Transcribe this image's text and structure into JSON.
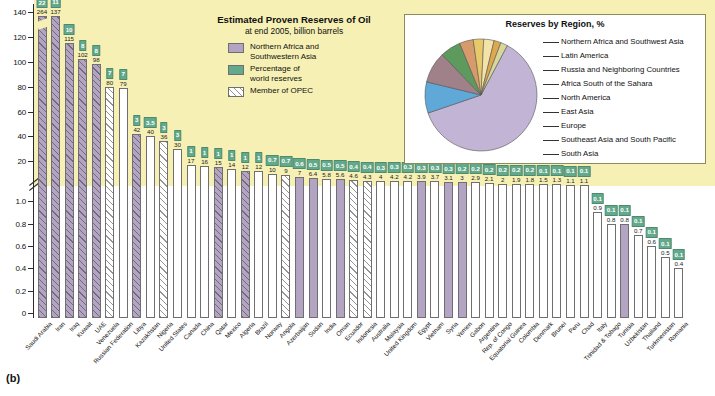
{
  "figure": {
    "caption": "(b)"
  },
  "legend": {
    "title": "Estimated Proven Reserves of Oil",
    "subtitle": "at end 2005, billion barrels",
    "items": [
      {
        "label": "Northern Africa and\nSouthwestern Asia",
        "color": "#b3a4c4",
        "pattern": "solid"
      },
      {
        "label": "Percentage of\nworld reserves",
        "color": "#63a98c",
        "pattern": "solid"
      },
      {
        "label": "Member of OPEC",
        "color": "#ffffff",
        "pattern": "hatched"
      }
    ]
  },
  "inset": {
    "title": "Reserves by Region, %",
    "labels": [
      "Northern Africa and Southwest Asia",
      "Latin America",
      "Russia and Neighboring Countries",
      "Africa South of the Sahara",
      "North America",
      "East Asia",
      "Europe",
      "Southeast Asia and South Pacific",
      "South Asia"
    ]
  },
  "chart_data": {
    "type": "bar",
    "title": "Estimated Proven Reserves of Oil",
    "subtitle": "at end 2005, billion barrels",
    "xlabel": "",
    "ylabel": "billion barrels",
    "axis_note": "broken axis: upper section 0-140 (major ticks every 20), lower section 0-1.0 (major ticks every 0.2)",
    "upper_ylim": [
      0,
      145
    ],
    "upper_ticks": [
      "0",
      "20",
      "40",
      "60",
      "80",
      "100",
      "120",
      "140"
    ],
    "lower_ylim": [
      0,
      1.1
    ],
    "lower_ticks": [
      "0",
      "0.2",
      "0.4",
      "0.6",
      "0.8",
      "1.0"
    ],
    "grid": false,
    "legend_position": "top-center",
    "categories": [
      "Saudi Arabia",
      "Iran",
      "Iraq",
      "Kuwait",
      "UAE",
      "Venezuela",
      "Russian Federation",
      "Libya",
      "Kazakhstan",
      "Nigeria",
      "United States",
      "Canada",
      "China",
      "Qatar",
      "Mexico",
      "Algeria",
      "Brazil",
      "Norway",
      "Angola",
      "Azerbaijan",
      "Sudan",
      "India",
      "Oman",
      "Ecuador",
      "Indonesia",
      "Australia",
      "Malaysia",
      "United Kingdom",
      "Egypt",
      "Vietnam",
      "Syria",
      "Yemen",
      "Gabon",
      "Argentina",
      "Rep. of Congo",
      "Equatorial Guinea",
      "Colombia",
      "Denmark",
      "Brunei",
      "Peru",
      "Chad",
      "Italy",
      "Trinidad & Tobago",
      "Tunisia",
      "Uzbekistan",
      "Thailand",
      "Turkmenistan",
      "Romania"
    ],
    "values": [
      264,
      137,
      115,
      102,
      98,
      80,
      79,
      42,
      40,
      36,
      30,
      17,
      16,
      15,
      14,
      12,
      12,
      10,
      9,
      7.0,
      6.4,
      5.8,
      5.6,
      4.6,
      4.3,
      4.0,
      4.2,
      4.2,
      3.9,
      3.7,
      3.1,
      3.0,
      2.9,
      2.1,
      2.0,
      1.9,
      1.8,
      1.5,
      1.3,
      1.1,
      1.1,
      0.9,
      0.8,
      0.8,
      0.7,
      0.6,
      0.5,
      0.4
    ],
    "percent_labels": [
      "22",
      "11",
      "10",
      "8",
      "8",
      "7",
      "7",
      "3",
      "3.5",
      "3",
      "3",
      "1",
      "1",
      "1",
      "1",
      "1",
      "1",
      "0.7",
      "0.7",
      "0.6",
      "0.5",
      "0.5",
      "0.5",
      "0.4",
      "0.4",
      "0.3",
      "0.3",
      "0.3",
      "0.3",
      "0.3",
      "0.3",
      "0.2",
      "0.2",
      "0.2",
      "0.2",
      "0.2",
      "0.2",
      "0.1",
      "0.1",
      "0.1",
      "0.1",
      "0.1",
      "0.1",
      "0.1",
      "0.1",
      "0.1",
      "0.1",
      "0.1"
    ],
    "is_northern_africa_southwest_asia": [
      true,
      true,
      true,
      true,
      true,
      false,
      false,
      true,
      false,
      false,
      false,
      false,
      false,
      true,
      false,
      true,
      false,
      false,
      false,
      true,
      true,
      false,
      true,
      false,
      false,
      false,
      false,
      false,
      true,
      false,
      true,
      true,
      false,
      false,
      false,
      false,
      false,
      false,
      false,
      false,
      false,
      false,
      false,
      true,
      false,
      false,
      false,
      false
    ],
    "is_opec": [
      true,
      true,
      true,
      true,
      true,
      true,
      false,
      true,
      false,
      true,
      false,
      false,
      false,
      true,
      false,
      true,
      false,
      false,
      true,
      false,
      false,
      false,
      false,
      true,
      true,
      false,
      false,
      false,
      false,
      false,
      false,
      false,
      false,
      false,
      false,
      false,
      false,
      false,
      false,
      false,
      false,
      false,
      false,
      false,
      false,
      false,
      false,
      false
    ],
    "pie": {
      "type": "pie",
      "title": "Reserves by Region, %",
      "labels": [
        "Northern Africa and Southwest Asia",
        "Latin America",
        "Russia and Neighboring Countries",
        "Africa South of the Sahara",
        "North America",
        "East Asia",
        "Europe",
        "Southeast Asia and South Pacific",
        "South Asia"
      ],
      "values": [
        62,
        9,
        9,
        6,
        4,
        3,
        3,
        2,
        2
      ],
      "colors": [
        "#c2b4d4",
        "#5fa8d8",
        "#a08089",
        "#5e9a5e",
        "#d79a6a",
        "#e8c96a",
        "#f3e3a8",
        "#e0a84e",
        "#d7d79a"
      ]
    }
  }
}
